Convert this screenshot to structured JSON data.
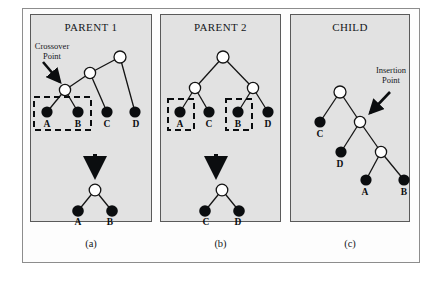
{
  "figure": {
    "panels": [
      {
        "id": "panel-a",
        "title": "PARENT 1",
        "caption": "(a)",
        "annotation": {
          "line1": "Crossover",
          "line2": "Point"
        }
      },
      {
        "id": "panel-b",
        "title": "PARENT 2",
        "caption": "(b)",
        "annotation": {
          "line1": "",
          "line2": ""
        }
      },
      {
        "id": "panel-c",
        "title": "CHILD",
        "caption": "(c)",
        "annotation": {
          "line1": "Insertion",
          "line2": "Point"
        }
      }
    ],
    "node_labels": {
      "p1_leaf_a": "A",
      "p1_leaf_b": "B",
      "p1_leaf_c": "C",
      "p1_leaf_d": "D",
      "p1_sub_a": "A",
      "p1_sub_b": "B",
      "p2_leaf_a": "A",
      "p2_leaf_c": "C",
      "p2_leaf_b": "B",
      "p2_leaf_d": "D",
      "p2_sub_c": "C",
      "p2_sub_d": "D",
      "child_c": "C",
      "child_d": "D",
      "child_a": "A",
      "child_b": "B"
    },
    "colors": {
      "panel_background": "#e2e2e2",
      "panel_border": "#5a5a5a",
      "frame_border": "#8d8d8d",
      "terminal_node_fill": "#0b0d0f",
      "function_node_fill": "#ffffff",
      "edge_stroke": "#141414",
      "dashed_box_stroke": "#0b0d0f",
      "text": "#15181b"
    }
  }
}
